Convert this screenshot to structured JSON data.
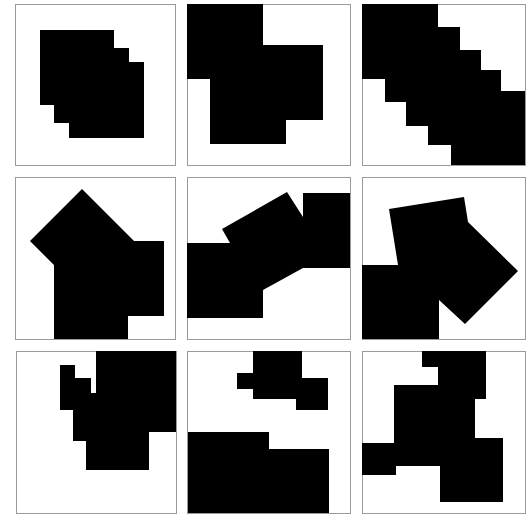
{
  "grid": {
    "rows": 3,
    "cols": 3,
    "fill_color": "#000000",
    "border_color": "#9a9a9a",
    "cells": [
      {
        "box": [
          15.5,
          4.5,
          160,
          161
        ],
        "polygons": [
          "40,30 114,30 114,48 129,48 129,62 144,62 144,138 69,138 69,123 54,123 54,105 40,105"
        ]
      },
      {
        "box": [
          187.5,
          4.5,
          163,
          161
        ],
        "polygons": [
          "187,4 263,4 263,45 323,45 323,120 286,120 286,144 210,144 210,79 187,79"
        ]
      },
      {
        "box": [
          362.5,
          4.5,
          163,
          161
        ],
        "polygons": [
          "362,4 438,4 438,27 460,27 460,50 481,50 481,70 501,70 501,91 525,91 525,165 451,165 451,145 428,145 428,126 406,126 406,102 385,102 385,79 362,79"
        ]
      },
      {
        "box": [
          15.5,
          177.5,
          160,
          162
        ],
        "polygons": [
          "82,189 134,241 164,241 164,316 128,316 128,339 54,339 54,265 30,241"
        ]
      },
      {
        "box": [
          187.5,
          177.5,
          163,
          162
        ],
        "polygons": [
          "187,243 230,243 222,229 287,192 303,217 303,193 350,193 350,268 303,268 263,290 263,318 187,318"
        ]
      },
      {
        "box": [
          362.5,
          177.5,
          163,
          162
        ],
        "polygons": [
          "362,265 398,265 389,209 464,197 468,222 518,271 465,324 439,300 439,339 362,339"
        ]
      },
      {
        "box": [
          16.5,
          351.5,
          160,
          162
        ],
        "polygons": [
          "96,351 176,351 176,432 149,432 149,470 86,470 86,441 73,441 73,410 60,410 60,365 75,365 75,378 91,378 91,393 96,393"
        ]
      },
      {
        "box": [
          187.5,
          351.5,
          163,
          162
        ],
        "polygons": [
          "253,351 302,351 302,378 328,378 328,410 296,410 296,399 253,399 253,389 237,389 237,373 253,373",
          "188,432 269,432 269,449 329,449 329,513 188,513"
        ]
      },
      {
        "box": [
          362.5,
          351.5,
          163,
          162
        ],
        "polygons": [
          "422,351 486,351 486,399 475,399 475,438 503,438 503,502 440,502 440,466 396,466 396,475 362,475 362,443 394,443 394,385 438,385 438,367 422,367"
        ]
      }
    ]
  }
}
